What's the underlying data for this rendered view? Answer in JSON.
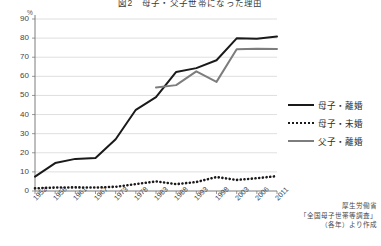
{
  "chart_data": {
    "type": "line",
    "title": "図2　母子・父子世帯になった理由",
    "xlabel": "",
    "ylabel": "%",
    "ylim": [
      0,
      90
    ],
    "yticks": [
      0,
      10,
      20,
      30,
      40,
      50,
      60,
      70,
      80,
      90
    ],
    "grid": true,
    "legend_position": "right",
    "categories": [
      "1952",
      "1956",
      "1961",
      "1967",
      "1973",
      "1978",
      "1983",
      "1988",
      "1993",
      "1998",
      "2003",
      "2006",
      "2011"
    ],
    "series": [
      {
        "name": "母子・離婚",
        "style": "solid",
        "color": "#1a1a1a",
        "values": [
          7.5,
          14.6,
          16.8,
          17.3,
          27.1,
          42.5,
          49.1,
          62.3,
          64.3,
          68.4,
          79.9,
          79.7,
          80.8
        ]
      },
      {
        "name": "母子・未婚",
        "style": "dotted",
        "color": "#1a1a1a",
        "values": [
          1.4,
          1.8,
          1.9,
          1.8,
          2.2,
          3.6,
          5.0,
          3.6,
          4.7,
          7.3,
          5.8,
          6.7,
          7.8
        ]
      },
      {
        "name": "父子・離婚",
        "style": "solid",
        "color": "#7d7d7d",
        "values": [
          null,
          null,
          null,
          null,
          null,
          null,
          54.2,
          55.4,
          62.6,
          57.1,
          74.2,
          74.4,
          74.3
        ]
      }
    ],
    "annotations": []
  },
  "source_note": {
    "line1": "厚生労働省",
    "line2": "「全国母子世帯等調査」",
    "line3": "（各年）より作成"
  }
}
